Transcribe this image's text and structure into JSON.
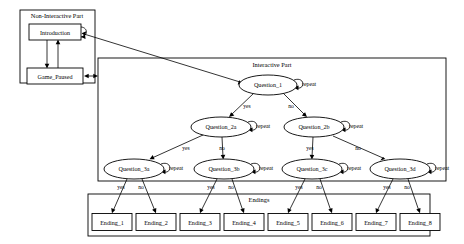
{
  "diagram": {
    "background_color": "#ffffff",
    "line_color": "#000000",
    "clusters": [
      {
        "id": "non_interactive",
        "label": "Non-Interactive Part",
        "x": 20,
        "y": 10,
        "w": 75,
        "h": 73,
        "label_x": 57,
        "label_y": 18
      },
      {
        "id": "interactive",
        "label": "Interactive Part",
        "x": 98,
        "y": 58,
        "w": 348,
        "h": 123,
        "label_x": 272,
        "label_y": 67
      },
      {
        "id": "endings",
        "label": "Endings",
        "x": 88,
        "y": 194,
        "w": 342,
        "h": 42,
        "label_x": 259,
        "label_y": 202
      }
    ],
    "boxes": [
      {
        "id": "introduction",
        "label": "Introduction",
        "cx": 55,
        "cy": 32,
        "w": 52,
        "h": 16
      },
      {
        "id": "game_paused",
        "label": "Game_Paused",
        "cx": 55,
        "cy": 76,
        "w": 56,
        "h": 16
      },
      {
        "id": "ending_1",
        "label": "Ending_1",
        "cx": 112,
        "cy": 222,
        "w": 40,
        "h": 17
      },
      {
        "id": "ending_2",
        "label": "Ending_2",
        "cx": 156,
        "cy": 222,
        "w": 40,
        "h": 17
      },
      {
        "id": "ending_3",
        "label": "Ending_3",
        "cx": 200,
        "cy": 222,
        "w": 40,
        "h": 17
      },
      {
        "id": "ending_4",
        "label": "Ending_4",
        "cx": 244,
        "cy": 222,
        "w": 40,
        "h": 17
      },
      {
        "id": "ending_5",
        "label": "Ending_5",
        "cx": 288,
        "cy": 222,
        "w": 40,
        "h": 17
      },
      {
        "id": "ending_6",
        "label": "Ending_6",
        "cx": 332,
        "cy": 222,
        "w": 40,
        "h": 17
      },
      {
        "id": "ending_7",
        "label": "Ending_7",
        "cx": 376,
        "cy": 222,
        "w": 40,
        "h": 17
      },
      {
        "id": "ending_8",
        "label": "Ending_8",
        "cx": 420,
        "cy": 222,
        "w": 40,
        "h": 17
      }
    ],
    "ellipses": [
      {
        "id": "question_1",
        "label": "Question_1",
        "cx": 268,
        "cy": 85,
        "rx": 29,
        "ry": 10
      },
      {
        "id": "question_2a",
        "label": "Question_2a",
        "cx": 221,
        "cy": 127,
        "rx": 30,
        "ry": 10
      },
      {
        "id": "question_2b",
        "label": "Question_2b",
        "cx": 314,
        "cy": 127,
        "rx": 30,
        "ry": 10
      },
      {
        "id": "question_3a",
        "label": "Question_3a",
        "cx": 134,
        "cy": 169,
        "rx": 30,
        "ry": 10
      },
      {
        "id": "question_3b",
        "label": "Question_3b",
        "cx": 224,
        "cy": 169,
        "rx": 30,
        "ry": 10
      },
      {
        "id": "question_3c",
        "label": "Question_3c",
        "cx": 312,
        "cy": 169,
        "rx": 30,
        "ry": 10
      },
      {
        "id": "question_3d",
        "label": "Question_3d",
        "cx": 400,
        "cy": 169,
        "rx": 30,
        "ry": 10
      }
    ],
    "self_loops": [
      {
        "id": "loop_question_1",
        "label": "repeat",
        "node": "question_1",
        "lx": 302,
        "ly": 86
      },
      {
        "id": "loop_question_2a",
        "label": "repeat",
        "node": "question_2a",
        "lx": 256,
        "ly": 128
      },
      {
        "id": "loop_question_2b",
        "label": "repeat",
        "node": "question_2b",
        "lx": 349,
        "ly": 128
      },
      {
        "id": "loop_question_3a",
        "label": "repeat",
        "node": "question_3a",
        "lx": 169,
        "ly": 170
      },
      {
        "id": "loop_question_3b",
        "label": "repeat",
        "node": "question_3b",
        "lx": 259,
        "ly": 170
      },
      {
        "id": "loop_question_3c",
        "label": "repeat",
        "node": "question_3c",
        "lx": 347,
        "ly": 170
      },
      {
        "id": "loop_question_3d",
        "label": "repeat",
        "node": "question_3d",
        "lx": 435,
        "ly": 170
      }
    ],
    "edge_labels": [
      {
        "id": "q1-yes",
        "label": "yes",
        "x": 247,
        "y": 108
      },
      {
        "id": "q1-no",
        "label": "no",
        "x": 291,
        "y": 108
      },
      {
        "id": "q2a-yes",
        "label": "yes",
        "x": 186,
        "y": 150
      },
      {
        "id": "q2a-no",
        "label": "no",
        "x": 222,
        "y": 150
      },
      {
        "id": "q2b-yes",
        "label": "yes",
        "x": 310,
        "y": 150
      },
      {
        "id": "q2b-no",
        "label": "no",
        "x": 358,
        "y": 150
      },
      {
        "id": "q3a-yes",
        "label": "yes",
        "x": 121,
        "y": 189
      },
      {
        "id": "q3a-no",
        "label": "no",
        "x": 141,
        "y": 189
      },
      {
        "id": "q3b-yes",
        "label": "yes",
        "x": 211,
        "y": 189
      },
      {
        "id": "q3b-no",
        "label": "no",
        "x": 231,
        "y": 189
      },
      {
        "id": "q3c-yes",
        "label": "yes",
        "x": 299,
        "y": 189
      },
      {
        "id": "q3c-no",
        "label": "no",
        "x": 319,
        "y": 189
      },
      {
        "id": "q3d-yes",
        "label": "yes",
        "x": 387,
        "y": 189
      },
      {
        "id": "q3d-no",
        "label": "no",
        "x": 407,
        "y": 189
      }
    ]
  }
}
